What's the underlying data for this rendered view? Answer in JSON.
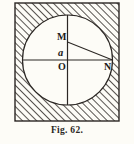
{
  "figure": {
    "caption": "Fig. 62.",
    "frame": {
      "shape": "square",
      "x": 15,
      "y": 3,
      "width": 104,
      "height": 118,
      "fill": "hatched",
      "hatch_direction": "lower-left-to-upper-right",
      "hatch_color": "#3a3632",
      "border_color": "#2b2724"
    },
    "circle": {
      "cx": 67.5,
      "cy": 60,
      "r": 45,
      "fill": "#fdfcf7",
      "stroke": "#2b2724"
    },
    "lines": [
      {
        "name": "vertical-diameter",
        "x1": 67.5,
        "y1": 15,
        "x2": 67.5,
        "y2": 105
      },
      {
        "name": "horizontal-diameter",
        "x1": 22.5,
        "y1": 60,
        "x2": 112.5,
        "y2": 60
      },
      {
        "name": "chord-m-to-n",
        "x1": 67.5,
        "y1": 42,
        "x2": 112.5,
        "y2": 60
      }
    ],
    "labels": [
      {
        "id": "m",
        "text": "M",
        "style": "roman-capital"
      },
      {
        "id": "a",
        "text": "a",
        "style": "italic-lowercase"
      },
      {
        "id": "o",
        "text": "O",
        "style": "roman-capital"
      },
      {
        "id": "n",
        "text": "N",
        "style": "roman-capital"
      }
    ],
    "colors": {
      "background": "#fdfcf7",
      "ink": "#2b2724",
      "hatch": "#3a3632"
    }
  }
}
